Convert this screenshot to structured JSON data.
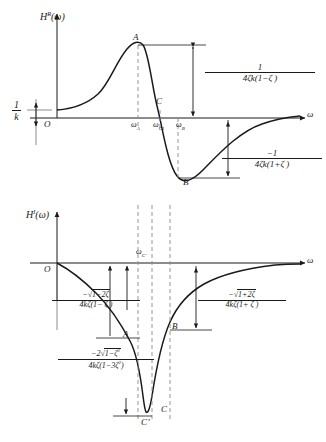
{
  "figure": {
    "stroke_color": "#1a1a1a",
    "dash_color": "#8a8a8a"
  },
  "top_plot": {
    "y_axis_label": "H",
    "y_axis_sup": "R",
    "y_axis_arg": "(ω)",
    "x_axis_label": "ω",
    "origin_label": "O",
    "offset_label_num": "1",
    "offset_label_den": "k",
    "points": [
      {
        "id": "A",
        "label": "A"
      },
      {
        "id": "C",
        "label": "C"
      },
      {
        "id": "B",
        "label": "B"
      }
    ],
    "ticks": [
      {
        "label": "ω",
        "sub": "A"
      },
      {
        "label": "ω",
        "sub": "C1"
      },
      {
        "label": "ω",
        "sub": "B"
      }
    ],
    "annotations": [
      {
        "id": "peak-amplitude",
        "num": "1",
        "den": "4ζk(1−ζ )"
      },
      {
        "id": "trough-amplitude",
        "num": "−1",
        "den": "4ζk(1+ζ )"
      }
    ]
  },
  "bottom_plot": {
    "y_axis_label": "H",
    "y_axis_sup": "I",
    "y_axis_arg": "(ω)",
    "x_axis_label": "ω",
    "origin_label": "O",
    "points": [
      {
        "id": "A",
        "label": "A"
      },
      {
        "id": "B",
        "label": "B"
      },
      {
        "id": "C",
        "label": "C"
      },
      {
        "id": "Cprime",
        "label": "C’"
      }
    ],
    "ticks": [
      {
        "label": "ω",
        "sub": "C’"
      }
    ],
    "annotations": [
      {
        "id": "left-amplitude",
        "num_sign": "−",
        "num_radicand": "1−2ζ",
        "den": "4kζ(1− ζ )"
      },
      {
        "id": "right-amplitude",
        "num_sign": "−",
        "num_radicand": "1+2ζ",
        "den": "4kζ(1+ ζ )"
      },
      {
        "id": "resonance-amplitude",
        "num_sign": "−2",
        "num_radicand": "1−ζ",
        "num_radicand_sup": "2",
        "den_pre": "4kζ(1−3ζ",
        "den_sup": "2",
        "den_post": ")"
      }
    ]
  }
}
